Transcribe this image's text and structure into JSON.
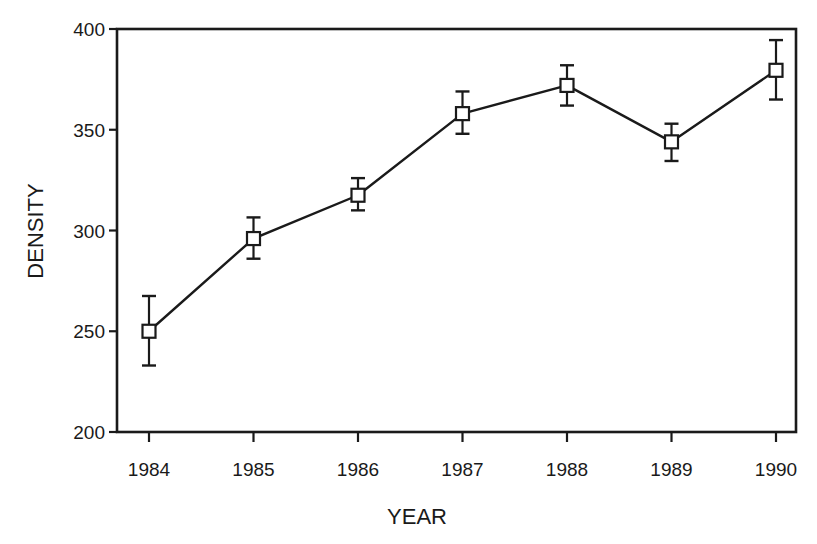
{
  "chart_data": {
    "type": "line",
    "title": "",
    "xlabel": "YEAR",
    "ylabel": "DENSITY",
    "categories": [
      "1984",
      "1985",
      "1986",
      "1987",
      "1988",
      "1989",
      "1990"
    ],
    "series": [
      {
        "name": "Density",
        "marker": "open-square",
        "values": [
          250,
          296,
          317.5,
          358,
          372,
          344,
          379.5
        ],
        "error_upper": [
          267.5,
          306.5,
          326,
          369,
          382,
          353,
          394.5
        ],
        "error_lower": [
          233,
          286,
          310,
          348,
          362,
          334.5,
          365
        ]
      }
    ],
    "ylim": [
      200,
      400
    ],
    "yticks": [
      200,
      250,
      300,
      350,
      400
    ],
    "grid": false,
    "legend": null
  },
  "axes": {
    "x_title": "YEAR",
    "y_title": "DENSITY",
    "x_tick_labels": [
      "1984",
      "1985",
      "1986",
      "1987",
      "1988",
      "1989",
      "1990"
    ],
    "y_tick_labels": [
      "200",
      "250",
      "300",
      "350",
      "400"
    ]
  },
  "colors": {
    "ink": "#1a1a1a",
    "background": "#ffffff"
  }
}
